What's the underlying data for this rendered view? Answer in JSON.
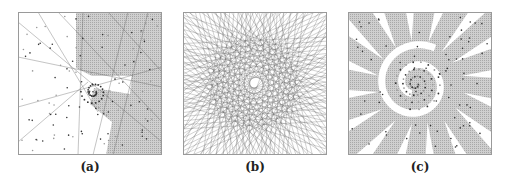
{
  "figure": {
    "panels": [
      {
        "id": "a",
        "caption": "(a)",
        "description": "Spiral point set with partial line arrangement; right half shaded region",
        "left": 18
      },
      {
        "id": "b",
        "caption": "(b)",
        "description": "Dense arrangement of lines forming spiral pattern",
        "left": 183
      },
      {
        "id": "c",
        "caption": "(c)",
        "description": "Spiral point set with shaded cells of arrangement",
        "left": 348
      }
    ],
    "colors": {
      "frame": "#9a9a9a",
      "shade": "#bdbdbd",
      "line": "#5a5a5a",
      "point_dark": "#333333",
      "point_light": "#999999"
    }
  }
}
